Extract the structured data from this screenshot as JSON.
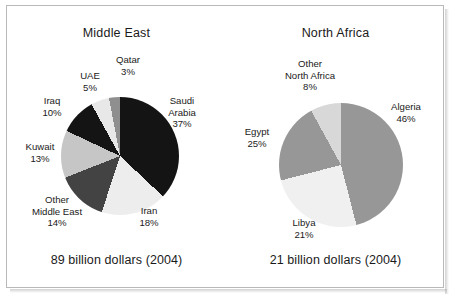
{
  "figure": {
    "border_color": "#b9b9b9",
    "background": "#ffffff"
  },
  "chart_data": [
    {
      "type": "pie",
      "title": "Middle East",
      "caption": "89 billion dollars (2004)",
      "unit": "percent",
      "total_label": "89 billion dollars",
      "year": "2004",
      "categories": [
        "Saudi Arabia",
        "Iran",
        "Other Middle East",
        "Kuwait",
        "Iraq",
        "UAE",
        "Qatar"
      ],
      "values": [
        37,
        18,
        14,
        13,
        10,
        5,
        3
      ],
      "colors": [
        "#141414",
        "#ededed",
        "#434343",
        "#c6c6c6",
        "#141414",
        "#e8e8e8",
        "#8f8f8f"
      ],
      "labels": [
        {
          "name": "Saudi Arabia",
          "line1": "Saudi",
          "line2": "Arabia",
          "pct": "37%",
          "value": 37,
          "color": "#141414"
        },
        {
          "name": "Iran",
          "line1": "Iran",
          "line2": "",
          "pct": "18%",
          "value": 18,
          "color": "#ededed"
        },
        {
          "name": "Other Middle East",
          "line1": "Other",
          "line2": "Middle East",
          "pct": "14%",
          "value": 14,
          "color": "#434343"
        },
        {
          "name": "Kuwait",
          "line1": "Kuwait",
          "line2": "",
          "pct": "13%",
          "value": 13,
          "color": "#c6c6c6"
        },
        {
          "name": "Iraq",
          "line1": "Iraq",
          "line2": "",
          "pct": "10%",
          "value": 10,
          "color": "#141414"
        },
        {
          "name": "UAE",
          "line1": "UAE",
          "line2": "",
          "pct": "5%",
          "value": 5,
          "color": "#e8e8e8"
        },
        {
          "name": "Qatar",
          "line1": "Qatar",
          "line2": "",
          "pct": "3%",
          "value": 3,
          "color": "#8f8f8f"
        }
      ],
      "legend": "labels-on-chart",
      "grid": false
    },
    {
      "type": "pie",
      "title": "North Africa",
      "caption": "21 billion dollars (2004)",
      "unit": "percent",
      "total_label": "21 billion dollars",
      "year": "2004",
      "categories": [
        "Algeria",
        "Egypt",
        "Libya",
        "Other North Africa"
      ],
      "values": [
        46,
        25,
        21,
        8
      ],
      "colors": [
        "#979797",
        "#f0f0f0",
        "#979797",
        "#d8d8d8"
      ],
      "labels": [
        {
          "name": "Algeria",
          "line1": "Algeria",
          "line2": "",
          "pct": "46%",
          "value": 46,
          "color": "#979797"
        },
        {
          "name": "Egypt",
          "line1": "Egypt",
          "line2": "",
          "pct": "25%",
          "value": 25,
          "color": "#f0f0f0"
        },
        {
          "name": "Libya",
          "line1": "Libya",
          "line2": "",
          "pct": "21%",
          "value": 21,
          "color": "#979797"
        },
        {
          "name": "Other North Africa",
          "line1": "Other",
          "line2": "North Africa",
          "pct": "8%",
          "value": 8,
          "color": "#d8d8d8"
        }
      ],
      "legend": "labels-on-chart",
      "grid": false
    }
  ]
}
